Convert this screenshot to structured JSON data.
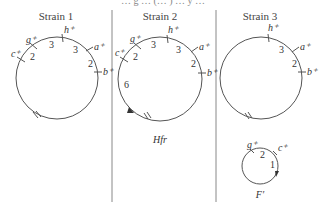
{
  "top_partial_text": "… g … (… ) … y …",
  "strains": [
    {
      "title": "Strain 1",
      "genes": [
        "g+",
        "h+",
        "a+",
        "b+",
        "c+"
      ],
      "distances": {
        "c_g": "2",
        "g_h": "3",
        "h_a": "3",
        "a_b": "2"
      },
      "has_break_mark": true
    },
    {
      "title": "Strain 2",
      "genes": [
        "g+",
        "h+",
        "a+",
        "b+",
        "c+"
      ],
      "distances": {
        "c_g": "2",
        "g_h": "3",
        "h_a": "3",
        "a_b": "2",
        "arc": "6"
      },
      "has_break_mark": true,
      "has_origin_arrow": true,
      "caption": "Hfr"
    },
    {
      "title": "Strain 3",
      "genes": [
        "h+",
        "a+",
        "b+"
      ],
      "distances": {
        "h_a": "3",
        "a_b": "2"
      },
      "has_break_mark": true,
      "episome": {
        "genes": [
          "g+",
          "c+"
        ],
        "distances": {
          "g_c": "2",
          "arc": "1"
        },
        "caption": "F′"
      }
    }
  ],
  "colors": {
    "line": "#555555",
    "divider": "#888888",
    "text": "#333333"
  }
}
